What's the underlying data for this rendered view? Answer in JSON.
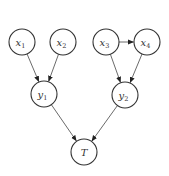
{
  "diagram": {
    "type": "directed-graph",
    "node_radius": 13,
    "colors": {
      "stroke": "#333333",
      "fill": "#ffffff",
      "edge": "#444444"
    },
    "nodes": [
      {
        "id": "x1",
        "label": "x",
        "sub": "1",
        "cx": 22,
        "cy": 42
      },
      {
        "id": "x2",
        "label": "x",
        "sub": "2",
        "cx": 63,
        "cy": 42
      },
      {
        "id": "x3",
        "label": "x",
        "sub": "3",
        "cx": 106,
        "cy": 42
      },
      {
        "id": "x4",
        "label": "x",
        "sub": "4",
        "cx": 147,
        "cy": 42
      },
      {
        "id": "y1",
        "label": "y",
        "sub": "1",
        "cx": 44,
        "cy": 94
      },
      {
        "id": "y2",
        "label": "y",
        "sub": "2",
        "cx": 125,
        "cy": 95
      },
      {
        "id": "T",
        "label": "T",
        "sub": "",
        "cx": 84,
        "cy": 152
      }
    ],
    "edges": [
      {
        "from": "x1",
        "to": "y1"
      },
      {
        "from": "x2",
        "to": "y1"
      },
      {
        "from": "x3",
        "to": "x4"
      },
      {
        "from": "x3",
        "to": "y2"
      },
      {
        "from": "x4",
        "to": "y2"
      },
      {
        "from": "y1",
        "to": "T"
      },
      {
        "from": "y2",
        "to": "T"
      }
    ]
  }
}
